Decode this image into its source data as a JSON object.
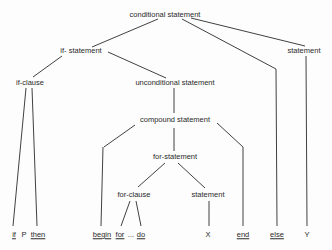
{
  "diagram": {
    "type": "parse-tree",
    "nodes": {
      "conditional_statement": "conditional statement",
      "if_statement": "if- statement",
      "statement_right": "statement",
      "if_clause": "if-clause",
      "unconditional_statement": "unconditional statement",
      "compound_statement": "compound statement",
      "for_statement": "for-statement",
      "for_clause": "for-clause",
      "statement_inner": "statement"
    },
    "leaves": {
      "if": "if",
      "P": "P",
      "then": "then",
      "begin": "begin",
      "for": "for",
      "ellipsis": "...",
      "do": "do",
      "X": "X",
      "end": "end",
      "else": "else",
      "Y": "Y"
    },
    "edges": [
      [
        "conditional statement",
        "if- statement"
      ],
      [
        "conditional statement",
        "else"
      ],
      [
        "conditional statement",
        "statement"
      ],
      [
        "if- statement",
        "if-clause"
      ],
      [
        "if- statement",
        "unconditional statement"
      ],
      [
        "if-clause",
        "if"
      ],
      [
        "if-clause",
        "then"
      ],
      [
        "unconditional statement",
        "compound statement"
      ],
      [
        "compound statement",
        "begin"
      ],
      [
        "compound statement",
        "for-statement"
      ],
      [
        "compound statement",
        "end"
      ],
      [
        "for-statement",
        "for-clause"
      ],
      [
        "for-statement",
        "statement"
      ],
      [
        "for-clause",
        "for"
      ],
      [
        "for-clause",
        "do"
      ],
      [
        "statement",
        "X"
      ],
      [
        "statement",
        "Y"
      ]
    ],
    "line_color": "#2b2b2b"
  }
}
